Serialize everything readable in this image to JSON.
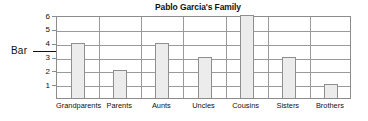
{
  "chart_data": {
    "type": "bar",
    "title": "Pablo Garcia's Family",
    "xlabel": "",
    "ylabel": "",
    "categories": [
      "Grandparents",
      "Parents",
      "Aunts",
      "Uncles",
      "Cousins",
      "Sisters",
      "Brothers"
    ],
    "values": [
      4,
      2,
      4,
      3,
      6,
      3,
      1
    ],
    "ylim": [
      0,
      6
    ],
    "yticks": [
      1,
      2,
      3,
      4,
      5,
      6
    ],
    "ytick_labels": [
      "1",
      "2",
      "3",
      "4",
      "5",
      "6"
    ],
    "grid": true,
    "legend": null,
    "annotations": [
      {
        "label": "Bar",
        "points_to": "Grandparents",
        "value": 4
      }
    ],
    "colors": {
      "bar_fill": "#ececec",
      "bar_border": "#8f8f8f",
      "gridline": "#9a9a9a",
      "frame": "#8c8c8c",
      "text": "#111111",
      "background": "#ffffff"
    }
  }
}
